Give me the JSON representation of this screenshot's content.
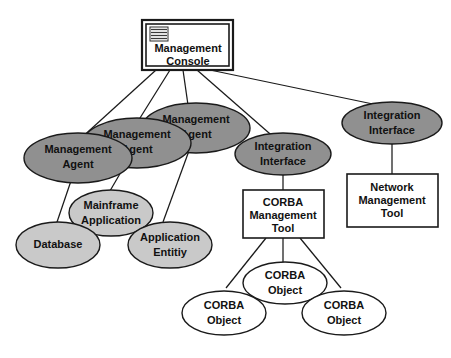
{
  "diagram": {
    "canvas": {
      "width": 451,
      "height": 358,
      "background": "#ffffff"
    },
    "colors": {
      "dark_node_fill": "#909090",
      "light_node_fill": "#c9c9c9",
      "white_node_fill": "#ffffff",
      "stroke": "#1a1a1a",
      "text": "#111111"
    },
    "nodes": {
      "management_console": {
        "shape": "double-box",
        "icon": "window-list-icon",
        "line1": "Management",
        "line2": "Console"
      },
      "agent_left": {
        "shape": "ellipse",
        "fill": "dark",
        "line1": "Management",
        "line2": "Agent"
      },
      "agent_mid": {
        "shape": "ellipse",
        "fill": "dark",
        "line1": "Management",
        "line2": "Agent"
      },
      "agent_right": {
        "shape": "ellipse",
        "fill": "dark",
        "line1": "Management",
        "line2": "Agent"
      },
      "integration_interface_center": {
        "shape": "ellipse",
        "fill": "dark",
        "line1": "Integration",
        "line2": "Interface"
      },
      "integration_interface_right": {
        "shape": "ellipse",
        "fill": "dark",
        "line1": "Integration",
        "line2": "Interface"
      },
      "database": {
        "shape": "ellipse",
        "fill": "light",
        "line1": "Database",
        "line2": ""
      },
      "mainframe_application": {
        "shape": "ellipse",
        "fill": "light",
        "line1": "Mainframe",
        "line2": "Application"
      },
      "application_entity": {
        "shape": "ellipse",
        "fill": "light",
        "line1": "Application",
        "line2": "Entitiy"
      },
      "corba_management_tool": {
        "shape": "box",
        "fill": "white",
        "line1": "CORBA",
        "line2": "Management",
        "line3": "Tool"
      },
      "network_management_tool": {
        "shape": "box",
        "fill": "white",
        "line1": "Network",
        "line2": "Management",
        "line3": "Tool"
      },
      "corba_object_left": {
        "shape": "ellipse",
        "fill": "white",
        "line1": "CORBA",
        "line2": "Object"
      },
      "corba_object_center": {
        "shape": "ellipse",
        "fill": "white",
        "line1": "CORBA",
        "line2": "Object"
      },
      "corba_object_right": {
        "shape": "ellipse",
        "fill": "white",
        "line1": "CORBA",
        "line2": "Object"
      }
    },
    "edges": [
      {
        "from": "management_console",
        "to": "agent_left"
      },
      {
        "from": "management_console",
        "to": "agent_mid"
      },
      {
        "from": "management_console",
        "to": "agent_right"
      },
      {
        "from": "management_console",
        "to": "integration_interface_center"
      },
      {
        "from": "management_console",
        "to": "integration_interface_right"
      },
      {
        "from": "agent_left",
        "to": "database"
      },
      {
        "from": "agent_mid",
        "to": "mainframe_application"
      },
      {
        "from": "agent_right",
        "to": "application_entity"
      },
      {
        "from": "integration_interface_center",
        "to": "corba_management_tool"
      },
      {
        "from": "integration_interface_right",
        "to": "network_management_tool"
      },
      {
        "from": "corba_management_tool",
        "to": "corba_object_left"
      },
      {
        "from": "corba_management_tool",
        "to": "corba_object_center"
      },
      {
        "from": "corba_management_tool",
        "to": "corba_object_right"
      }
    ]
  }
}
